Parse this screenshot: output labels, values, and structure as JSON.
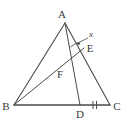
{
  "figure": {
    "kind": "plane-geometry-triangle-with-cevians",
    "canvas": {
      "width": 126,
      "height": 126,
      "background": "#ffffff"
    },
    "stroke": {
      "color": "#4a4a4a",
      "width": 1
    },
    "points": {
      "A": {
        "x": 65,
        "y": 23,
        "label": "A",
        "label_x": 62,
        "label_y": 18
      },
      "B": {
        "x": 14,
        "y": 105,
        "label": "B",
        "label_x": 4,
        "label_y": 109
      },
      "C": {
        "x": 110,
        "y": 105,
        "label": "C",
        "label_x": 113,
        "label_y": 110
      },
      "D": {
        "x": 80,
        "y": 105,
        "label": "D",
        "label_x": 76,
        "label_y": 117
      },
      "E": {
        "x": 84,
        "y": 48,
        "label": "E",
        "label_x": 86,
        "label_y": 52
      },
      "F": {
        "x": 66,
        "y": 74,
        "label": "F",
        "label_x": 60,
        "label_y": 77
      }
    },
    "segments": [
      {
        "name": "side-AB",
        "from": "A",
        "to": "B"
      },
      {
        "name": "side-AC",
        "from": "A",
        "to": "C"
      },
      {
        "name": "side-BC",
        "from": "B",
        "to": "C"
      },
      {
        "name": "cevian-AD",
        "from": "A",
        "to": "D"
      },
      {
        "name": "cevian-BE",
        "from": "B",
        "to": "E"
      }
    ],
    "tick_marks": {
      "segment": "DC",
      "count": 2,
      "note": "double tick marks indicating DC congruence"
    },
    "angle_marker": {
      "at": "A",
      "label": "x",
      "label_x": 90,
      "label_y": 36,
      "arrow_from_x": 88,
      "arrow_from_y": 38,
      "arrow_to_x": 76,
      "arrow_to_y": 44
    }
  }
}
